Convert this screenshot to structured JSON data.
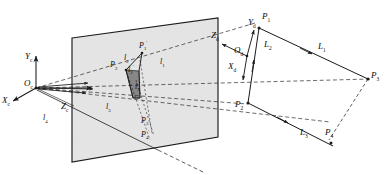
{
  "figure": {
    "type": "technical-line-diagram",
    "width": 389,
    "height": 175,
    "background_color": "#ffffff",
    "ink_color": "#1a1a1a",
    "image_plane_fill": "#e2e2e2"
  },
  "camera_frame": {
    "origin_label": "O",
    "origin_sub": "c",
    "axes": [
      {
        "name": "x-axis",
        "label": "X",
        "sub": "c"
      },
      {
        "name": "y-axis",
        "label": "Y",
        "sub": "c"
      },
      {
        "name": "z-axis",
        "label": "Z",
        "sub": "c"
      }
    ]
  },
  "object_frame": {
    "origin_label": "O",
    "origin_sub": "d",
    "axes": [
      {
        "name": "x-axis",
        "label": "X",
        "sub": "d"
      },
      {
        "name": "y-axis",
        "label": "Y",
        "sub": "d"
      },
      {
        "name": "z-axis",
        "label": "Z",
        "sub": "d"
      }
    ]
  },
  "object_points": [
    {
      "label": "P",
      "sub": "1"
    },
    {
      "label": "P",
      "sub": "2"
    },
    {
      "label": "P",
      "sub": "3"
    },
    {
      "label": "P",
      "sub": "4"
    }
  ],
  "object_lines": [
    {
      "label": "L",
      "sub": "1"
    },
    {
      "label": "L",
      "sub": "2"
    },
    {
      "label": "L",
      "sub": "3"
    }
  ],
  "image_points": [
    {
      "label": "P",
      "sub": "1",
      "prime": "′"
    },
    {
      "label": "P",
      "sub": "2",
      "prime": "′"
    },
    {
      "label": "P",
      "sub": "3",
      "prime": "′"
    },
    {
      "label": "P",
      "sub": "4",
      "prime": "′"
    }
  ],
  "image_lines": [
    {
      "label": "l",
      "sub": "1",
      "prime": "′"
    },
    {
      "label": "l",
      "sub": "2",
      "prime": "′"
    },
    {
      "label": "l",
      "sub": "3",
      "prime": "′"
    }
  ],
  "projection_rays": [
    {
      "label": "l",
      "sub": "1"
    },
    {
      "label": "l",
      "sub": "2"
    },
    {
      "label": "l",
      "sub": "3"
    },
    {
      "label": "l",
      "sub": "4"
    }
  ],
  "labels": {
    "Xc": "X",
    "Xc_sub": "c",
    "Yc": "Y",
    "Yc_sub": "c",
    "Zc": "Z",
    "Zc_sub": "c",
    "Oc": "O",
    "Oc_sub": "c",
    "Xd": "X",
    "Xd_sub": "d",
    "Yd": "Y",
    "Yd_sub": "d",
    "Zd": "Z",
    "Zd_sub": "d",
    "Od": "O",
    "Od_sub": "d",
    "P1": "P",
    "P1_sub": "1",
    "P2": "P",
    "P2_sub": "2",
    "P3": "P",
    "P3_sub": "3",
    "P4": "P",
    "P4_sub": "4",
    "L1": "L",
    "L1_sub": "1",
    "L2": "L",
    "L2_sub": "2",
    "L3": "L",
    "L3_sub": "3",
    "P1p": "P",
    "P1p_sub": "1",
    "P2p": "P",
    "P2p_sub": "2",
    "P3p": "P",
    "P3p_sub": "3",
    "P4p": "P",
    "P4p_sub": "4",
    "l1p": "l",
    "l1p_sub": "1",
    "l2p": "l",
    "l2p_sub": "2",
    "l3p": "l",
    "l3p_sub": "3",
    "l1": "l",
    "l1_sub": "1",
    "l2": "l",
    "l2_sub": "2",
    "l3": "l",
    "l3_sub": "3",
    "l4": "l",
    "l4_sub": "4",
    "prime": "′"
  }
}
